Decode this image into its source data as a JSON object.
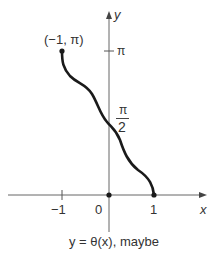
{
  "figure": {
    "axis_x_label": "x",
    "axis_y_label": "y",
    "point_label": "(−1, π)",
    "y_tick_pi": "π",
    "y_tick_half_pi_num": "π",
    "y_tick_half_pi_den": "2",
    "x_tick_neg1": "−1",
    "x_tick_0": "0",
    "x_tick_1": "1",
    "caption": "y = θ(x), maybe"
  },
  "colors": {
    "curve": "#1a1a1a",
    "axis": "#555555",
    "text": "#333333"
  }
}
